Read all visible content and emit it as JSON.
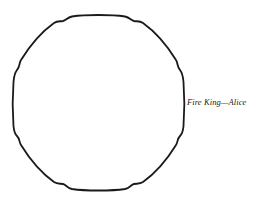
{
  "diagram": {
    "shape": "rounded-octagon-outline",
    "stroke_color": "#1a1a1a",
    "label": "Fire King—Alice"
  }
}
